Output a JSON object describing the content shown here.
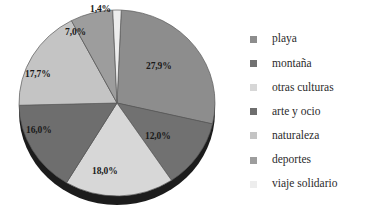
{
  "chart_data": {
    "type": "pie",
    "title": "",
    "subtitle": "",
    "xlabel": "",
    "ylabel": "",
    "legend_position": "right",
    "grid": false,
    "value_suffix": "%",
    "decimal_separator": ",",
    "categories": [
      "playa",
      "montaña",
      "otras culturas",
      "arte y ocio",
      "naturaleza",
      "deportes",
      "viaje solidario"
    ],
    "values": [
      27.9,
      12.0,
      18.0,
      16.0,
      17.7,
      7.0,
      1.4
    ],
    "labels": [
      "27,9%",
      "12,0%",
      "18,0%",
      "16,0%",
      "17,7%",
      "7,0%",
      "1,4%"
    ],
    "colors": [
      "#8d8d8d",
      "#717171",
      "#d7d7d7",
      "#6e6e6e",
      "#c4c4c4",
      "#9d9d9d",
      "#ededed"
    ],
    "slices": [
      {
        "name": "playa",
        "value": 27.9,
        "label": "27,9%",
        "color": "#8d8d8d",
        "swatch_color": "#8d8d8d",
        "start_angle": 2.5,
        "end_angle": 103.0,
        "label_x": 146,
        "label_y": 62,
        "label_anchor": "left"
      },
      {
        "name": "montaña",
        "value": 12.0,
        "label": "12,0%",
        "color": "#717171",
        "swatch_color": "#717171",
        "start_angle": 103.0,
        "end_angle": 146.2,
        "label_x": 145,
        "label_y": 132,
        "label_anchor": "left"
      },
      {
        "name": "otras culturas",
        "value": 18.0,
        "label": "18,0%",
        "color": "#d7d7d7",
        "swatch_color": "#d7d7d7",
        "start_angle": 146.2,
        "end_angle": 211.0,
        "label_x": 92,
        "label_y": 167,
        "label_anchor": "left"
      },
      {
        "name": "arte y ocio",
        "value": 16.0,
        "label": "16,0%",
        "color": "#6e6e6e",
        "swatch_color": "#6e6e6e",
        "start_angle": 211.0,
        "end_angle": 268.6,
        "label_x": 26,
        "label_y": 126,
        "label_anchor": "left"
      },
      {
        "name": "naturaleza",
        "value": 17.7,
        "label": "17,7%",
        "color": "#c4c4c4",
        "swatch_color": "#c4c4c4",
        "start_angle": 268.6,
        "end_angle": 332.3,
        "label_x": 25,
        "label_y": 70,
        "label_anchor": "left"
      },
      {
        "name": "deportes",
        "value": 7.0,
        "label": "7,0%",
        "color": "#9d9d9d",
        "swatch_color": "#9d9d9d",
        "start_angle": 332.3,
        "end_angle": 357.5,
        "label_x": 65,
        "label_y": 28,
        "label_anchor": "left"
      },
      {
        "name": "viaje solidario",
        "value": 1.4,
        "label": "1,4%",
        "color": "#ededed",
        "swatch_color": "#ededed",
        "start_angle": 357.5,
        "end_angle": 362.5,
        "label_x": 90,
        "label_y": 5,
        "label_anchor": "left"
      }
    ]
  },
  "legend": {
    "items": [
      {
        "label": "playa",
        "color": "#8d8d8d"
      },
      {
        "label": "montaña",
        "color": "#717171"
      },
      {
        "label": "otras culturas",
        "color": "#d7d7d7"
      },
      {
        "label": "arte y ocio",
        "color": "#6e6e6e"
      },
      {
        "label": "naturaleza",
        "color": "#c4c4c4"
      },
      {
        "label": "deportes",
        "color": "#9d9d9d"
      },
      {
        "label": "viaje solidario",
        "color": "#ededed"
      }
    ]
  },
  "pie_geometry": {
    "center_x": 117,
    "center_y": 103,
    "radius_x": 98,
    "radius_y": 93,
    "depth": 9,
    "rim_color": "#1c1c1c",
    "outline_color": "#5a5a5a"
  }
}
